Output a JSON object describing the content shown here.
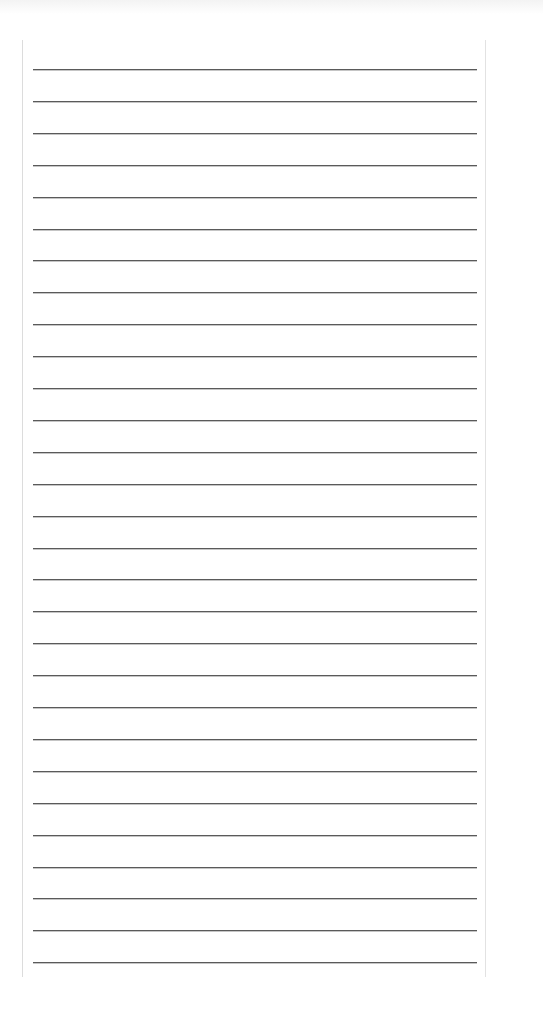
{
  "page": {
    "type": "blank ruled notebook page",
    "background_color": "#ffffff",
    "rule_color": "#5a5a5a",
    "border_color": "#dcdcdc"
  },
  "sheet": {
    "rule_count": 29,
    "first_rule_y": 29,
    "rule_spacing_px": 31.9,
    "lines": [
      "",
      "",
      "",
      "",
      "",
      "",
      "",
      "",
      "",
      "",
      "",
      "",
      "",
      "",
      "",
      "",
      "",
      "",
      "",
      "",
      "",
      "",
      "",
      "",
      "",
      "",
      "",
      "",
      ""
    ]
  }
}
